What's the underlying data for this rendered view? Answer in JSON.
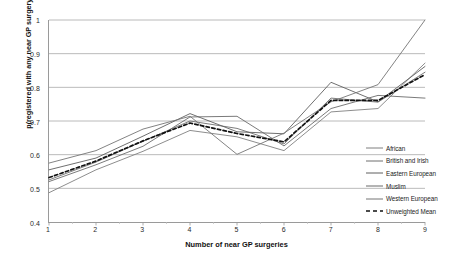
{
  "chart_data": {
    "type": "line",
    "title": "",
    "xlabel": "Number of near GP surgeries",
    "ylabel": "p(registered with any near GP surgery)",
    "x": [
      1,
      2,
      3,
      4,
      5,
      6,
      7,
      8,
      9
    ],
    "xlim": [
      1,
      9
    ],
    "ylim": [
      0.4,
      1.0
    ],
    "ytick_labels": [
      "0.4",
      "0.5",
      "0.6",
      "0.7",
      "0.8",
      "0.9",
      "1"
    ],
    "yticks": [
      0.4,
      0.5,
      0.6,
      0.7,
      0.8,
      0.9,
      1.0
    ],
    "xtick_labels": [
      "1",
      "2",
      "3",
      "4",
      "5",
      "6",
      "7",
      "8",
      "9"
    ],
    "grid": "horizontal",
    "legend_position": "right",
    "series": [
      {
        "name": "African",
        "color": "#7f7f7f",
        "style": "solid",
        "values": [
          0.487,
          0.555,
          0.61,
          0.672,
          0.653,
          0.612,
          0.727,
          0.737,
          0.872
        ]
      },
      {
        "name": "British and Irish",
        "color": "#6e6e6e",
        "style": "solid",
        "values": [
          0.525,
          0.578,
          0.64,
          0.7,
          0.678,
          0.632,
          0.768,
          0.756,
          0.845
        ]
      },
      {
        "name": "Eastern European",
        "color": "#5e5e5e",
        "style": "solid",
        "values": [
          0.555,
          0.59,
          0.655,
          0.722,
          0.668,
          0.662,
          0.815,
          0.757,
          0.862
        ]
      },
      {
        "name": "Muslim",
        "color": "#6a6a6a",
        "style": "solid",
        "values": [
          0.52,
          0.57,
          0.625,
          0.712,
          0.714,
          0.626,
          0.737,
          0.776,
          0.768
        ]
      },
      {
        "name": "Western European",
        "color": "#747474",
        "style": "solid",
        "values": [
          0.575,
          0.612,
          0.676,
          0.714,
          0.601,
          0.664,
          0.757,
          0.808,
          1.0
        ]
      },
      {
        "name": "Unweighted Mean",
        "color": "#111111",
        "style": "dashed",
        "values": [
          0.532,
          0.581,
          0.641,
          0.694,
          0.663,
          0.638,
          0.761,
          0.761,
          0.838
        ]
      }
    ]
  }
}
